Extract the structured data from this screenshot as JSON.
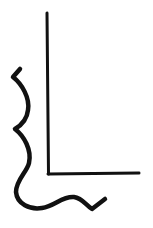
{
  "drawing": {
    "background": "#ffffff",
    "stroke_color": "#111111",
    "shapes": [
      {
        "name": "right-angle-vertical-line",
        "type": "line",
        "from": [
          47,
          13
        ],
        "to": [
          48,
          174
        ]
      },
      {
        "name": "right-angle-horizontal-line",
        "type": "line",
        "from": [
          48,
          174
        ],
        "to": [
          139,
          173
        ]
      },
      {
        "name": "wavy-border-curve",
        "type": "curve"
      }
    ]
  }
}
